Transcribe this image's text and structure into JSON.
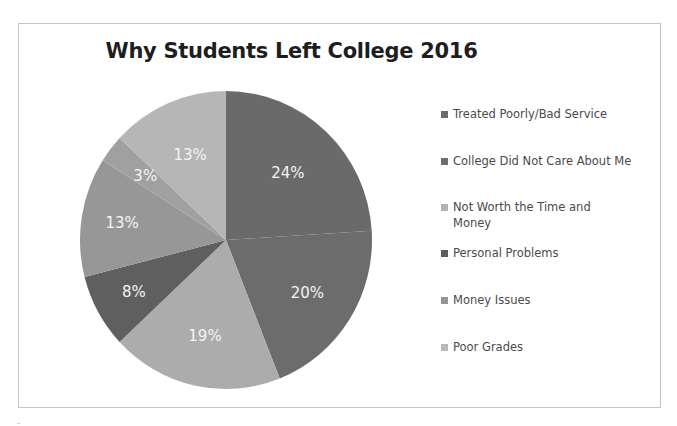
{
  "chart_data": {
    "type": "pie",
    "title": "Why Students Left College 2016",
    "legend_position": "right",
    "legend": [
      {
        "label": "Treated Poorly/Bad Service",
        "color": "#6b6b6b"
      },
      {
        "label": "College Did Not Care About Me",
        "color": "#6e6e6e"
      },
      {
        "label": "Not Worth the Time and Money",
        "color": "#b2b2b2"
      },
      {
        "label": "Personal Problems",
        "color": "#5e5e5e"
      },
      {
        "label": "Money Issues",
        "color": "#959595"
      },
      {
        "label": "Poor Grades",
        "color": "#b8b8b8"
      }
    ],
    "slices": [
      {
        "label": "24%",
        "value": 24,
        "color": "#6a6a6a"
      },
      {
        "label": "20%",
        "value": 20,
        "color": "#6c6c6c"
      },
      {
        "label": "19%",
        "value": 19,
        "color": "#acacac"
      },
      {
        "label": "8%",
        "value": 8,
        "color": "#5f5f5f"
      },
      {
        "label": "13%",
        "value": 13,
        "color": "#979797"
      },
      {
        "label": "3%",
        "value": 3,
        "color": "#a0a0a0"
      },
      {
        "label": "13%",
        "value": 13,
        "color": "#b6b6b6"
      }
    ],
    "data_labels_shown": true,
    "start_angle": "12 o'clock",
    "direction": "clockwise"
  }
}
